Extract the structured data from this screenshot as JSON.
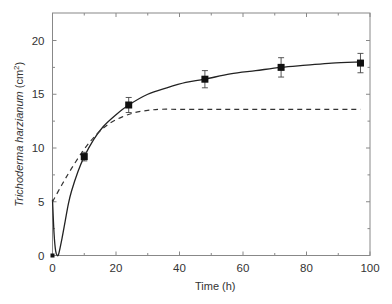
{
  "chart_data": {
    "type": "line",
    "title": "",
    "xlabel": "Time (h)",
    "ylabel_italic": "Trichoderma harzianum",
    "ylabel_unit": " (cm",
    "ylabel_sup": "2",
    "ylabel_close": ")",
    "xlim": [
      0,
      100
    ],
    "ylim": [
      0,
      22.5
    ],
    "x_ticks": [
      0,
      20,
      40,
      60,
      80,
      100
    ],
    "x_minor_ticks": [
      10,
      30,
      50,
      70,
      90
    ],
    "y_ticks": [
      0,
      5,
      10,
      15,
      20
    ],
    "y_minor_ticks": [
      2.5,
      7.5,
      12.5,
      17.5
    ],
    "grid": false,
    "legend": null,
    "series": [
      {
        "name": "Observed",
        "style": "markers",
        "marker": "square",
        "x": [
          0,
          10,
          24,
          48,
          72,
          97
        ],
        "y": [
          0,
          9.2,
          14.0,
          16.4,
          17.5,
          17.9
        ],
        "error": [
          0,
          0.4,
          0.7,
          0.8,
          0.9,
          0.9
        ]
      },
      {
        "name": "Model fit (solid)",
        "style": "solid",
        "x": [
          0,
          0.5,
          1,
          1.5,
          2,
          3,
          4,
          5,
          6,
          8,
          10,
          13,
          16,
          20,
          24,
          30,
          36,
          42,
          48,
          56,
          64,
          72,
          80,
          88,
          97
        ],
        "y": [
          5.2,
          2.0,
          0.4,
          0.0,
          0.2,
          1.6,
          3.2,
          4.8,
          6.0,
          7.8,
          9.2,
          10.8,
          12.0,
          13.1,
          14.0,
          15.0,
          15.6,
          16.1,
          16.4,
          16.9,
          17.2,
          17.5,
          17.7,
          17.9,
          18.0
        ]
      },
      {
        "name": "Model fit (dashed)",
        "style": "dashed",
        "x": [
          0,
          3,
          6,
          10,
          14,
          18,
          22,
          26,
          30,
          34,
          40,
          50,
          60,
          70,
          80,
          90,
          97
        ],
        "y": [
          5.0,
          6.6,
          8.1,
          9.9,
          11.3,
          12.3,
          12.9,
          13.3,
          13.5,
          13.6,
          13.6,
          13.6,
          13.6,
          13.6,
          13.6,
          13.6,
          13.6
        ]
      }
    ]
  }
}
